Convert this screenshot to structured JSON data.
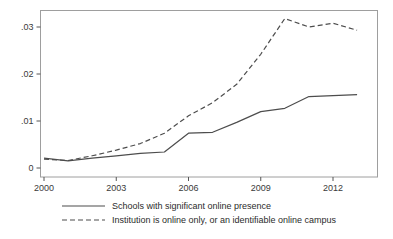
{
  "chart_data": {
    "type": "line",
    "title": "",
    "subtitle": "",
    "xlabel": "",
    "ylabel": "",
    "xlim": [
      2000,
      2013
    ],
    "ylim": [
      0,
      0.0335
    ],
    "grid": false,
    "legend_position": "bottom",
    "x": [
      2000,
      2001,
      2002,
      2003,
      2004,
      2005,
      2006,
      2007,
      2008,
      2009,
      2010,
      2011,
      2012,
      2013
    ],
    "xticks": [
      2000,
      2003,
      2006,
      2009,
      2012
    ],
    "xticklabels": [
      "2000",
      "2003",
      "2006",
      "2009",
      "2012"
    ],
    "yticks": [
      0,
      0.01,
      0.02,
      0.03
    ],
    "yticklabels": [
      "0",
      ".01",
      ".02",
      ".03"
    ],
    "series": [
      {
        "name": "Schools with significant online presence",
        "style": "solid",
        "color": "#4d4d4d",
        "values": [
          0.0021,
          0.0015,
          0.0021,
          0.0026,
          0.0031,
          0.0034,
          0.0074,
          0.0076,
          0.0097,
          0.012,
          0.0127,
          0.0152,
          0.0154,
          0.0156
        ]
      },
      {
        "name": "Institution is online only, or an identifiable online campus",
        "style": "dashed",
        "color": "#4d4d4d",
        "values": [
          0.0019,
          0.0016,
          0.0026,
          0.0038,
          0.0052,
          0.0074,
          0.0111,
          0.0139,
          0.0178,
          0.0242,
          0.0318,
          0.03,
          0.0308,
          0.0293
        ]
      }
    ]
  },
  "axes": {
    "x_ticks": [
      {
        "label": "2000",
        "value": 2000
      },
      {
        "label": "2003",
        "value": 2003
      },
      {
        "label": "2006",
        "value": 2006
      },
      {
        "label": "2009",
        "value": 2009
      },
      {
        "label": "2012",
        "value": 2012
      }
    ],
    "y_ticks": [
      {
        "label": "0",
        "value": 0
      },
      {
        "label": ".01",
        "value": 0.01
      },
      {
        "label": ".02",
        "value": 0.02
      },
      {
        "label": ".03",
        "value": 0.03
      }
    ]
  },
  "legend": {
    "entries": [
      {
        "label": "Schools with significant online presence",
        "style": "solid"
      },
      {
        "label": "Institution is online only, or an identifiable online campus",
        "style": "dashed"
      }
    ]
  },
  "colors": {
    "line": "#4d4d4d",
    "frame": "#9a9a9a",
    "axis": "#555555",
    "text": "#2b2b2b",
    "background": "#ffffff"
  }
}
